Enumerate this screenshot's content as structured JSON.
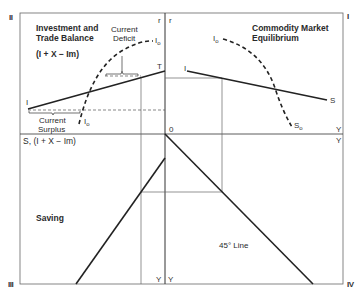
{
  "quadrants": {
    "q1": {
      "numeral": "I",
      "title_line1": "Commodity Market",
      "title_line2": "Equilibrium"
    },
    "q2": {
      "numeral": "II",
      "title_line1": "Investment and",
      "title_line2": "Trade Balance",
      "formula": "(I + X − Im)"
    },
    "q3": {
      "numeral": "III",
      "title": "Saving"
    },
    "q4": {
      "numeral": "IV",
      "title": "45° Line"
    }
  },
  "axes": {
    "r_left": "r",
    "r_right": "r",
    "origin": "0",
    "y_q1": "Y",
    "y_q4": "Y",
    "y_q3": "Y",
    "y_q3b": "Y",
    "s_axis": "S, (I + X − Im)"
  },
  "curves": {
    "q2_solid_start": "I",
    "q2_solid_end": "T",
    "q2_dashed_top": "I",
    "q2_dashed_top_sub": "o",
    "q2_dashed_bottom": "I",
    "q2_dashed_bottom_sub": "o",
    "q1_solid_start": "I",
    "q1_solid_end": "S",
    "q1_dashed_top": "I",
    "q1_dashed_top_sub": "o",
    "q1_dashed_bottom": "S",
    "q1_dashed_bottom_sub": "o"
  },
  "annotations": {
    "deficit_line1": "Current",
    "deficit_line2": "Deficit",
    "surplus_line1": "Current",
    "surplus_line2": "Surplus"
  },
  "colors": {
    "ink": "#2a2a2a",
    "frame": "#555555",
    "guide": "#666666"
  }
}
